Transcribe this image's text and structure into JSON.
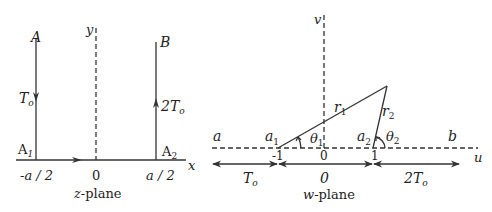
{
  "z_plane": {
    "caption_var": "z",
    "caption_rest": "-plane",
    "axis_x_label": "x",
    "axis_y_label": "y",
    "point_A": "A",
    "point_B": "B",
    "point_A1": "A",
    "point_A1_sub": "1",
    "point_A2": "A",
    "point_A2_sub": "2",
    "left_boundary_label": "T",
    "left_boundary_sub": "o",
    "right_boundary_label": "2T",
    "right_boundary_sub": "o",
    "tick_left": "-a / 2",
    "tick_origin": "0",
    "tick_right": "a / 2"
  },
  "w_plane": {
    "caption_var": "w",
    "caption_rest": "-plane",
    "axis_u_label": "u",
    "axis_v_label": "v",
    "region_a": "a",
    "region_b": "b",
    "point_a1": "a",
    "point_a1_sub": "1",
    "point_a2": "a",
    "point_a2_sub": "2",
    "r1": "r",
    "r1_sub": "1",
    "r2": "r",
    "r2_sub": "2",
    "theta1": "θ",
    "theta1_sub": "1",
    "theta2": "θ",
    "theta2_sub": "2",
    "tick_minus1": "-1",
    "tick_origin": "0",
    "tick_plus1": "1",
    "segment_left_label": "T",
    "segment_left_sub": "o",
    "segment_mid_label": "0",
    "segment_right_label": "2T",
    "segment_right_sub": "o"
  }
}
